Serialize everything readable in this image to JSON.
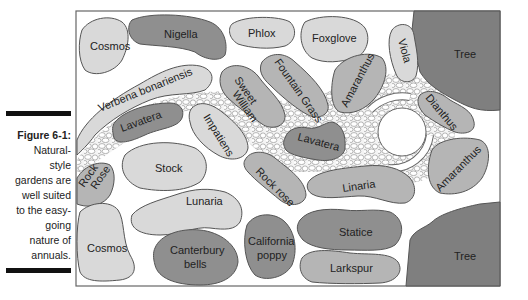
{
  "caption": {
    "title": "Figure 6-1:",
    "lines": [
      "Natural-",
      "style",
      "gardens are",
      "well suited",
      "to the easy-",
      "going",
      "nature of",
      "annuals."
    ]
  },
  "colors": {
    "light": "#d9d9d9",
    "medium": "#b5b5b5",
    "dark": "#8f8f8f",
    "tree": "#7f7f7f",
    "outline": "#555555",
    "path_fill": "#f2f2f2"
  },
  "plants": {
    "cosmos_top": "Cosmos",
    "nigella": "Nigella",
    "phlox": "Phlox",
    "foxglove": "Foxglove",
    "viola": "Viola",
    "tree_top": "Tree",
    "verbena": "Verbena bonariensis",
    "sweet": "Sweet",
    "william": "William",
    "fountain_grass": "Fountain Grass",
    "amaranthus_top": "Amaranthus",
    "dianthus": "Dianthus",
    "lavatera_left": "Lavatera",
    "impatiens": "Impatiens",
    "lavatera_mid": "Lavatera",
    "rock": "Rock",
    "rose_cap": "Rose",
    "stock": "Stock",
    "rock_rose": "Rock rose",
    "linaria": "Linaria",
    "amaranthus_right": "Amaranthus",
    "lunaria": "Lunaria",
    "cosmos_bottom": "Cosmos",
    "canterbury": "Canterbury",
    "bells": "bells",
    "california": "California",
    "poppy": "poppy",
    "statice": "Statice",
    "larkspur": "Larkspur",
    "tree_bottom": "Tree"
  }
}
